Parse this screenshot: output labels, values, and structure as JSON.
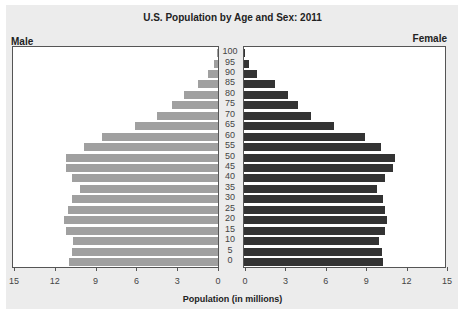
{
  "chart_data": {
    "type": "bar",
    "subtype": "population-pyramid",
    "title": "U.S. Population by Age and Sex: 2011",
    "xlabel": "Population (in millions)",
    "ylabel": "",
    "left_label": "Male",
    "right_label": "Female",
    "categories": [
      "0",
      "5",
      "10",
      "15",
      "20",
      "25",
      "30",
      "35",
      "40",
      "45",
      "50",
      "55",
      "60",
      "65",
      "70",
      "75",
      "80",
      "85",
      "90",
      "95",
      "100"
    ],
    "series": [
      {
        "name": "Male",
        "color": "#a0a0a0",
        "values": [
          10.9,
          10.7,
          10.6,
          11.1,
          11.3,
          11.0,
          10.7,
          10.1,
          10.7,
          11.1,
          11.1,
          9.8,
          8.5,
          6.1,
          4.5,
          3.4,
          2.5,
          1.5,
          0.7,
          0.3,
          0.05
        ]
      },
      {
        "name": "Female",
        "color": "#333333",
        "values": [
          10.4,
          10.3,
          10.1,
          10.5,
          10.7,
          10.5,
          10.4,
          9.9,
          10.5,
          11.1,
          11.3,
          10.2,
          9.0,
          6.7,
          5.0,
          4.0,
          3.3,
          2.3,
          1.0,
          0.4,
          0.1
        ]
      }
    ],
    "xlim": [
      0,
      15
    ],
    "male_ticks": [
      "15",
      "12",
      "9",
      "6",
      "3",
      "0"
    ],
    "female_ticks": [
      "0",
      "3",
      "6",
      "9",
      "12",
      "15"
    ],
    "grid": false,
    "legend": "none"
  }
}
